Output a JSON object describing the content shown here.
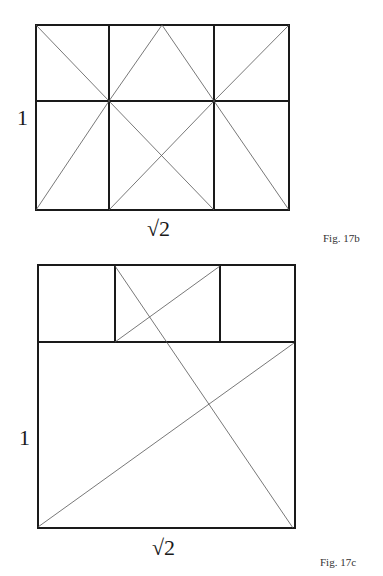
{
  "figures": [
    {
      "id": "17b",
      "caption": "Fig. 17b",
      "side_label": "1",
      "bottom_label": "√2",
      "stroke_color": "#1a1a1a",
      "outer": {
        "x1": 36,
        "y1": 25,
        "x2": 289,
        "y2": 210
      },
      "grid_lines": [
        {
          "x1": 109,
          "y1": 25,
          "x2": 109,
          "y2": 210
        },
        {
          "x1": 214,
          "y1": 25,
          "x2": 214,
          "y2": 210
        },
        {
          "x1": 36,
          "y1": 101,
          "x2": 289,
          "y2": 101
        }
      ],
      "diagonals": [
        {
          "x1": 36,
          "y1": 25,
          "x2": 109,
          "y2": 101
        },
        {
          "x1": 109,
          "y1": 101,
          "x2": 162,
          "y2": 25
        },
        {
          "x1": 162,
          "y1": 25,
          "x2": 214,
          "y2": 101
        },
        {
          "x1": 214,
          "y1": 101,
          "x2": 289,
          "y2": 25
        },
        {
          "x1": 36,
          "y1": 210,
          "x2": 109,
          "y2": 101
        },
        {
          "x1": 109,
          "y1": 101,
          "x2": 214,
          "y2": 210
        },
        {
          "x1": 109,
          "y1": 210,
          "x2": 214,
          "y2": 101
        },
        {
          "x1": 214,
          "y1": 101,
          "x2": 289,
          "y2": 210
        }
      ]
    },
    {
      "id": "17c",
      "caption": "Fig. 17c",
      "side_label": "1",
      "bottom_label": "√2",
      "stroke_color": "#1a1a1a",
      "outer": {
        "x1": 38,
        "y1": 265,
        "x2": 295,
        "y2": 528
      },
      "grid_lines": [
        {
          "x1": 38,
          "y1": 342,
          "x2": 295,
          "y2": 342
        },
        {
          "x1": 115,
          "y1": 265,
          "x2": 115,
          "y2": 342
        },
        {
          "x1": 220,
          "y1": 265,
          "x2": 220,
          "y2": 342
        }
      ],
      "diagonals": [
        {
          "x1": 115,
          "y1": 266,
          "x2": 293,
          "y2": 528
        },
        {
          "x1": 115,
          "y1": 342,
          "x2": 220,
          "y2": 266
        },
        {
          "x1": 38,
          "y1": 527,
          "x2": 294,
          "y2": 343
        }
      ]
    }
  ]
}
